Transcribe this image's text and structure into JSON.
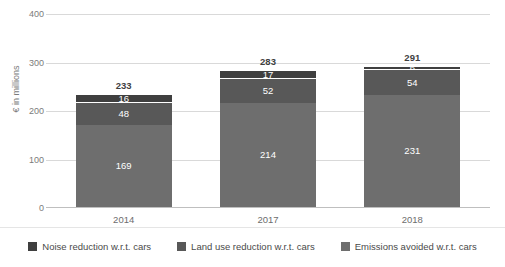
{
  "chart_data": {
    "type": "bar",
    "subtype": "stacked-column",
    "title": "",
    "xlabel": "",
    "ylabel": "€ in millions",
    "ylim": [
      0,
      400
    ],
    "yticks": [
      0,
      100,
      200,
      300,
      400
    ],
    "grid": true,
    "legend_position": "bottom",
    "categories": [
      "2014",
      "2017",
      "2018"
    ],
    "totals": [
      233,
      283,
      291
    ],
    "series": [
      {
        "name": "Emissions avoided w.r.t. cars",
        "color": "#6e6e6e",
        "values": [
          169,
          214,
          231
        ]
      },
      {
        "name": "Land use reduction w.r.t. cars",
        "color": "#585858",
        "values": [
          48,
          52,
          54
        ]
      },
      {
        "name": "Noise reduction w.r.t. cars",
        "color": "#3f3f3f",
        "values": [
          16,
          17,
          6
        ]
      }
    ]
  },
  "legend": {
    "items": [
      {
        "label": "Noise reduction w.r.t. cars",
        "color": "#3f3f3f"
      },
      {
        "label": "Land use reduction w.r.t. cars",
        "color": "#585858"
      },
      {
        "label": "Emissions avoided w.r.t. cars",
        "color": "#6e6e6e"
      }
    ]
  },
  "axis": {
    "y_tick_labels": [
      "400",
      "300",
      "200",
      "100",
      "0"
    ],
    "y_axis_title": "€ in millions",
    "x_tick_labels": [
      "2014",
      "2017",
      "2018"
    ]
  }
}
